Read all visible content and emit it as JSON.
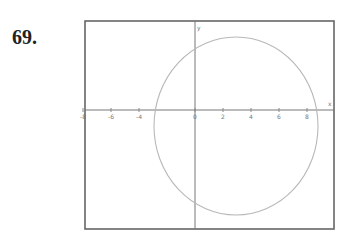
{
  "problem": {
    "number": "69."
  },
  "chart_data": {
    "type": "line",
    "title": "",
    "xlabel": "x",
    "ylabel": "y",
    "grid": false,
    "x_ticks": [
      -8,
      -6,
      -4,
      0,
      2,
      4,
      6,
      8
    ],
    "x_tick_labels": [
      "-8",
      "-6",
      "-4",
      "0",
      "2",
      "4",
      "6",
      "8"
    ],
    "xlim": [
      -10,
      10
    ],
    "ylim": [
      -8,
      6
    ],
    "series": [
      {
        "name": "circle",
        "shape": "circle",
        "center": [
          3,
          -1
        ],
        "radius": 6,
        "color": "#b5b5b5"
      }
    ],
    "annotations": [
      "y",
      "x"
    ]
  }
}
